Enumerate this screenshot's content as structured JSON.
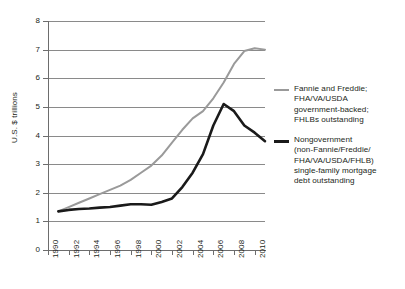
{
  "chart_data": {
    "type": "line",
    "title": "",
    "subtitle": "",
    "xlabel": "",
    "ylabel": "U.S. $ trillions",
    "xlim": [
      1990,
      2011
    ],
    "ylim": [
      0,
      8
    ],
    "xticks": [
      "1990",
      "1992",
      "1994",
      "1996",
      "1998",
      "2000",
      "2002",
      "2004",
      "2006",
      "2008",
      "2010"
    ],
    "yticks": [
      "0",
      "1",
      "2",
      "3",
      "4",
      "5",
      "6",
      "7",
      "8"
    ],
    "grid": "horizontal",
    "legend_position": "right",
    "x": [
      1991,
      1992,
      1993,
      1994,
      1995,
      1996,
      1997,
      1998,
      1999,
      2000,
      2001,
      2002,
      2003,
      2004,
      2005,
      2006,
      2007,
      2008,
      2009,
      2010,
      2011
    ],
    "series": [
      {
        "name": "Fannie and Freddie; FHA/VA/USDA government-backed; FHLBs outstanding",
        "color": "#9a9a9a",
        "values": [
          1.35,
          1.5,
          1.65,
          1.8,
          1.95,
          2.1,
          2.25,
          2.45,
          2.7,
          2.95,
          3.3,
          3.75,
          4.2,
          4.6,
          4.85,
          5.3,
          5.85,
          6.5,
          6.95,
          7.05,
          7.0
        ]
      },
      {
        "name": "Nongovernment (non-Fannie/Freddie/FHA/VA/USDA/FHLB) single-family mortgage debt outstanding",
        "color": "#1a1a1a",
        "values": [
          1.35,
          1.4,
          1.43,
          1.45,
          1.48,
          1.5,
          1.55,
          1.6,
          1.6,
          1.58,
          1.68,
          1.8,
          2.2,
          2.7,
          3.35,
          4.35,
          5.1,
          4.85,
          4.35,
          4.1,
          3.8
        ]
      }
    ]
  },
  "axes": {
    "y_title": "U.S. $ trillions",
    "y_ticks": [
      "8",
      "7",
      "6",
      "5",
      "4",
      "3",
      "2",
      "1",
      "0"
    ],
    "x_ticks": [
      "1990",
      "1992",
      "1994",
      "1996",
      "1998",
      "2000",
      "2002",
      "2004",
      "2006",
      "2008",
      "2010"
    ]
  },
  "legend": {
    "entries": [
      {
        "swatch": "gray",
        "lines": [
          "Fannie and Freddie;",
          "FHA/VA/USDA",
          "government-backed;",
          "FHLBs outstanding"
        ]
      },
      {
        "swatch": "black",
        "lines": [
          "Nongovernment",
          "(non-Fannie/Freddie/",
          "FHA/VA/USDA/FHLB)",
          "single-family mortgage",
          "debt outstanding"
        ]
      }
    ]
  },
  "colors": {
    "series_gray": "#9a9a9a",
    "series_black": "#1a1a1a",
    "gridline": "#8a8a8a",
    "axis": "#6d6d6d",
    "text": "#231f20",
    "background": "#ffffff"
  }
}
